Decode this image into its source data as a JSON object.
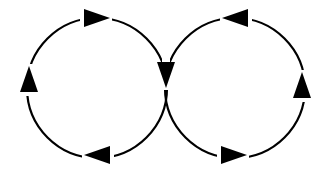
{
  "diagram": {
    "type": "figure-eight-flow",
    "colors": {
      "stroke": "#000000",
      "background": "#ffffff"
    },
    "loops": [
      {
        "name": "left-loop",
        "center": [
          97,
          88
        ],
        "radius": 70,
        "direction": "clockwise",
        "arrows": [
          {
            "name": "left-top-arrow",
            "position": [
              96,
              18
            ],
            "points": "right"
          },
          {
            "name": "left-side-arrow",
            "position": [
              29,
              80
            ],
            "points": "up"
          },
          {
            "name": "left-bottom-arrow",
            "position": [
              98,
              155
            ],
            "points": "left"
          }
        ]
      },
      {
        "name": "right-loop",
        "center": [
          235,
          88
        ],
        "radius": 70,
        "direction": "counterclockwise",
        "arrows": [
          {
            "name": "right-top-arrow",
            "position": [
              236,
              18
            ],
            "points": "left"
          },
          {
            "name": "right-side-arrow",
            "position": [
              302,
              86
            ],
            "points": "up"
          },
          {
            "name": "right-bottom-arrow",
            "position": [
              233,
              155
            ],
            "points": "right"
          }
        ]
      }
    ],
    "shared_arrow": {
      "name": "center-crossing-arrow",
      "position": [
        166,
        74
      ],
      "points": "down"
    }
  }
}
